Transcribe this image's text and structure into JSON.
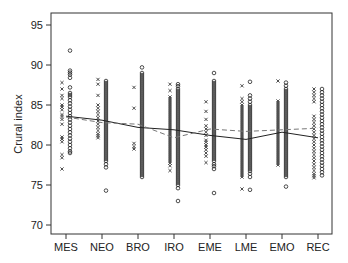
{
  "chart_data": {
    "type": "scatter",
    "title": "",
    "xlabel": "",
    "ylabel": "Crural index",
    "ylim": [
      68.9,
      96.4
    ],
    "yticks": [
      70,
      75,
      80,
      85,
      90,
      95
    ],
    "grid": false,
    "legend": "none",
    "categories": [
      "MES",
      "NEO",
      "BRO",
      "IRO",
      "EME",
      "LME",
      "EMO",
      "REC"
    ],
    "markers": {
      "x_series": "x marks plotted left of each category tick",
      "o_series": "open circles plotted right of each category tick"
    },
    "groups": [
      {
        "category": "MES",
        "x_points": [
          87.8,
          87.0,
          86.2,
          85.8,
          85.0,
          84.4,
          83.8,
          83.2,
          82.6,
          81.0,
          80.4,
          78.8,
          78.4,
          77.0
        ],
        "o_points": [
          91.8,
          89.3,
          88.8,
          88.4,
          87.2,
          86.5,
          86.0,
          85.6,
          85.2,
          84.8,
          84.4,
          84.0,
          83.6,
          83.2,
          82.8,
          82.4,
          82.0,
          81.6,
          81.2,
          80.8,
          80.4,
          80.0,
          79.6,
          79.2,
          79.0
        ]
      },
      {
        "category": "NEO",
        "x_points": [
          88.2,
          87.6,
          86.2,
          85.0,
          84.6,
          84.2,
          83.8,
          83.4,
          83.0,
          82.6,
          82.2,
          81.8,
          81.4,
          80.9
        ],
        "o_points": [
          88.0,
          87.5,
          87.0,
          86.5,
          86.0,
          85.5,
          85.0,
          84.5,
          84.0,
          83.5,
          83.0,
          82.5,
          82.0,
          81.5,
          81.0,
          80.5,
          80.0,
          79.5,
          79.0,
          78.5,
          78.0,
          77.6,
          77.2,
          74.3
        ]
      },
      {
        "category": "BRO",
        "x_points": [
          87.2,
          84.6,
          80.2,
          79.8,
          79.5
        ],
        "o_points": [
          89.7,
          89.0,
          88.5,
          88.0,
          87.5,
          87.0,
          86.5,
          86.0,
          85.5,
          85.0,
          84.5,
          84.0,
          83.5,
          83.0,
          82.5,
          82.0,
          81.5,
          81.0,
          80.5,
          80.0,
          79.5,
          79.0,
          78.5,
          78.0,
          77.5,
          77.0,
          76.5,
          76.0
        ]
      },
      {
        "category": "IRO",
        "x_points": [
          87.6,
          86.8,
          86.0,
          85.5,
          85.0,
          84.5,
          84.0,
          83.5,
          83.0,
          82.5,
          82.0,
          81.5,
          81.0,
          80.5,
          80.0,
          79.5,
          79.0,
          78.5,
          78.0,
          77.4,
          76.8
        ],
        "o_points": [
          87.6,
          87.0,
          86.5,
          86.0,
          85.5,
          85.0,
          84.5,
          84.0,
          83.5,
          83.0,
          82.5,
          82.0,
          81.5,
          81.0,
          80.5,
          80.0,
          79.5,
          79.0,
          78.5,
          78.0,
          77.5,
          77.0,
          76.5,
          76.0,
          75.5,
          75.0,
          74.6,
          73.0
        ]
      },
      {
        "category": "EME",
        "x_points": [
          85.4,
          84.2,
          83.2,
          82.4,
          82.0,
          81.6,
          81.2,
          80.6,
          80.0,
          79.4,
          79.0,
          78.6,
          77.8
        ],
        "o_points": [
          89.0,
          88.0,
          87.5,
          87.0,
          86.5,
          86.0,
          85.5,
          85.0,
          84.5,
          84.0,
          83.5,
          83.0,
          82.5,
          82.0,
          81.5,
          81.0,
          80.5,
          80.0,
          79.5,
          79.0,
          78.5,
          78.0,
          77.6,
          77.0,
          74.0
        ]
      },
      {
        "category": "LME",
        "x_points": [
          87.4,
          85.8,
          85.4,
          85.0,
          84.5,
          84.0,
          83.5,
          83.0,
          82.5,
          82.0,
          81.5,
          81.0,
          80.5,
          80.0,
          79.5,
          79.0,
          78.5,
          78.0,
          77.5,
          77.0,
          76.5,
          76.0,
          74.5
        ],
        "o_points": [
          87.9,
          86.2,
          85.8,
          85.4,
          85.0,
          84.5,
          84.0,
          83.5,
          83.0,
          82.5,
          82.0,
          81.5,
          81.0,
          80.5,
          80.0,
          79.5,
          79.0,
          78.5,
          78.0,
          77.5,
          77.0,
          76.4,
          76.0,
          74.4
        ]
      },
      {
        "category": "EMO",
        "x_points": [
          88.0,
          85.5,
          85.0,
          84.5,
          84.0,
          83.5,
          83.0,
          82.5,
          82.0,
          81.5,
          81.0,
          80.5,
          80.0,
          79.5,
          79.0,
          78.5,
          78.0,
          77.5
        ],
        "o_points": [
          87.8,
          87.4,
          87.0,
          86.5,
          86.0,
          85.5,
          85.0,
          84.5,
          84.0,
          83.5,
          83.0,
          82.5,
          82.0,
          81.5,
          81.0,
          80.5,
          80.0,
          79.5,
          79.0,
          78.5,
          78.0,
          77.5,
          77.0,
          76.5,
          76.0,
          74.8
        ]
      },
      {
        "category": "REC",
        "x_points": [
          87.0,
          86.6,
          86.2,
          85.8,
          85.4,
          83.6,
          83.2,
          82.8,
          82.4,
          82.0,
          81.6,
          81.2,
          80.8,
          80.4,
          80.0,
          79.6,
          79.2,
          78.8,
          78.4,
          78.0,
          77.6,
          77.2,
          76.8,
          76.4,
          75.9
        ],
        "o_points": [
          87.0,
          86.6,
          86.2,
          85.8,
          85.4,
          85.0,
          84.6,
          84.2,
          83.8,
          83.4,
          83.0,
          82.6,
          82.2,
          81.8,
          81.4,
          81.0,
          80.6,
          80.2,
          79.8,
          79.4,
          79.0,
          78.6,
          78.2,
          77.8,
          77.4,
          77.0,
          76.6,
          76.2
        ]
      }
    ],
    "series": [
      {
        "name": "solid trend",
        "style": "solid",
        "values": [
          83.6,
          83.1,
          82.2,
          81.9,
          81.2,
          80.7,
          81.6,
          80.9
        ]
      },
      {
        "name": "dashed trend",
        "style": "dashed",
        "values": [
          83.5,
          82.8,
          82.6,
          80.9,
          82.0,
          81.7,
          81.9,
          82.1
        ]
      }
    ]
  },
  "colors": {
    "background": "#ffffff",
    "ink": "#222222",
    "frame": "#333333"
  }
}
